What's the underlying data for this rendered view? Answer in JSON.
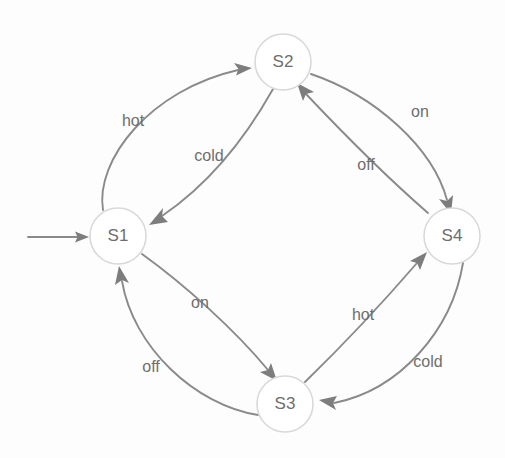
{
  "diagram": {
    "type": "state-transition-diagram",
    "title": "",
    "canvas": {
      "width": 505,
      "height": 458,
      "background": "#fdfdfd"
    },
    "colors": {
      "node_stroke": "#d9d9d9",
      "node_fill": "#ffffff",
      "node_text": "#6e6e6e",
      "edge_stroke": "#8a8a8a",
      "edge_label_text": "#6e6e6e",
      "arrow_head": "#7d7d7d"
    },
    "node_radius": 28,
    "start_marker": {
      "label": "start-arrow",
      "from_x": 28,
      "to_x": 88,
      "y": 237
    },
    "nodes": [
      {
        "id": "S1",
        "label": "S1",
        "cx": 118,
        "cy": 236,
        "initial": true
      },
      {
        "id": "S2",
        "label": "S2",
        "cx": 283,
        "cy": 62,
        "initial": false
      },
      {
        "id": "S3",
        "label": "S3",
        "cx": 285,
        "cy": 404,
        "initial": false
      },
      {
        "id": "S4",
        "label": "S4",
        "cx": 452,
        "cy": 236,
        "initial": false
      }
    ],
    "transitions": [
      {
        "id": "s1-s2",
        "from": "S1",
        "to": "S2",
        "label": "hot",
        "label_x": 133,
        "label_y": 122
      },
      {
        "id": "s2-s1",
        "from": "S2",
        "to": "S1",
        "label": "cold",
        "label_x": 209,
        "label_y": 157
      },
      {
        "id": "s2-s4",
        "from": "S2",
        "to": "S4",
        "label": "on",
        "label_x": 420,
        "label_y": 113
      },
      {
        "id": "s4-s2",
        "from": "S4",
        "to": "S2",
        "label": "off",
        "label_x": 366,
        "label_y": 166
      },
      {
        "id": "s1-s3",
        "from": "S1",
        "to": "S3",
        "label": "on",
        "label_x": 200,
        "label_y": 304
      },
      {
        "id": "s3-s1",
        "from": "S3",
        "to": "S1",
        "label": "off",
        "label_x": 151,
        "label_y": 368
      },
      {
        "id": "s3-s4",
        "from": "S3",
        "to": "S4",
        "label": "hot",
        "label_x": 363,
        "label_y": 316
      },
      {
        "id": "s4-s3",
        "from": "S4",
        "to": "S3",
        "label": "cold",
        "label_x": 428,
        "label_y": 363
      }
    ]
  }
}
